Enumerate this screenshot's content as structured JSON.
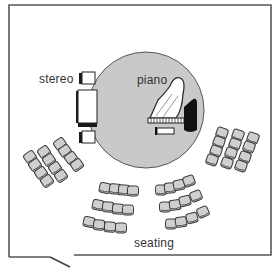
{
  "diagram": {
    "type": "floor-plan",
    "labels": {
      "stereo": "stereo",
      "piano": "piano",
      "seating": "seating"
    },
    "colors": {
      "wall": "#555555",
      "stage_circle": "#c9c9c9",
      "seat_fill": "#cfcfcf",
      "seat_stroke": "#444444",
      "furniture_dark": "#1a1a1a"
    },
    "elements": [
      {
        "name": "room-walls",
        "kind": "outline"
      },
      {
        "name": "door-opening",
        "kind": "door",
        "position": "bottom-left"
      },
      {
        "name": "stage-circle",
        "kind": "circle"
      },
      {
        "name": "stereo",
        "kind": "equipment",
        "parts": [
          "speaker",
          "console",
          "speaker"
        ]
      },
      {
        "name": "piano",
        "kind": "grand-piano"
      },
      {
        "name": "seating",
        "kind": "seat-groups",
        "groups": [
          {
            "position": "left",
            "rows": 3,
            "seats_per_row": [
              4,
              4,
              4
            ]
          },
          {
            "position": "center-left",
            "rows": 3,
            "seats_per_row": [
              4,
              4,
              4
            ]
          },
          {
            "position": "center-right",
            "rows": 3,
            "seats_per_row": [
              4,
              4,
              4
            ]
          },
          {
            "position": "right",
            "rows": 3,
            "seats_per_row": [
              4,
              4,
              4
            ]
          }
        ]
      }
    ]
  }
}
